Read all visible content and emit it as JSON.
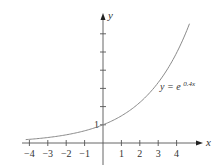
{
  "chart_data": {
    "type": "line",
    "title": "",
    "function": "y = e^{0.4x}",
    "series": [
      {
        "name": "y = e^0.4x",
        "x": [
          -4.2,
          -4,
          -3,
          -2,
          -1,
          0,
          1,
          2,
          3,
          4,
          4.7
        ],
        "values": [
          0.186,
          0.202,
          0.301,
          0.449,
          0.67,
          1.0,
          1.492,
          2.226,
          3.32,
          4.953,
          6.554
        ]
      }
    ],
    "xlabel": "x",
    "ylabel": "y",
    "x_ticks": [
      "-4",
      "-3",
      "-2",
      "-1",
      "1",
      "2",
      "3",
      "4"
    ],
    "x_tick_values": [
      -4,
      -3,
      -2,
      -1,
      1,
      2,
      3,
      4
    ],
    "y_ticks": [
      "1"
    ],
    "y_tick_values": [
      1,
      2,
      3,
      4,
      5,
      6
    ],
    "xlim": [
      -4.2,
      5.2
    ],
    "ylim": [
      -1.2,
      6.5
    ],
    "grid": false,
    "legend": "none",
    "annotations": [
      {
        "text": "y = e",
        "superscript": "0.4x",
        "x": 3.5,
        "y": 2.4
      }
    ],
    "colors": {
      "curve": "#8a8a8a",
      "axes": "#555555"
    }
  },
  "labels": {
    "x_axis": "x",
    "y_axis": "y",
    "y_one": "1",
    "eq_main": "y = e",
    "eq_sup": "0.4x"
  }
}
